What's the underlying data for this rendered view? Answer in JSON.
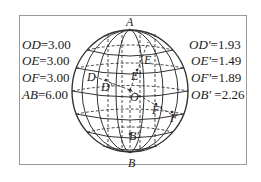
{
  "left_values": [
    {
      "label": "OD",
      "value": "=3.00"
    },
    {
      "label": "OE",
      "value": "=3.00"
    },
    {
      "label": "OF",
      "value": "=3.00"
    },
    {
      "label": "AB",
      "value": "=6.00"
    }
  ],
  "right_values": [
    {
      "label": "OD'",
      "value": "=1.93"
    },
    {
      "label": "OE'",
      "value": "=1.49"
    },
    {
      "label": "OF'",
      "value": "=1.89"
    },
    {
      "label": "OB'",
      "value": " =2.26"
    }
  ],
  "points": {
    "A": "A",
    "B": "B",
    "O": "O",
    "D": "D",
    "D_prime": "D'",
    "E": "E",
    "E_prime": "E'",
    "F": "F",
    "F_prime": "F'",
    "B_prime": "B'"
  },
  "colors": {
    "line": "#333333",
    "frame": "#9a9a9a",
    "text": "#1a1a1a"
  }
}
